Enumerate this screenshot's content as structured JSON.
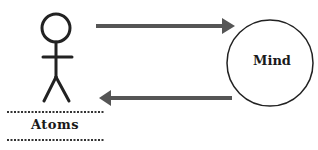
{
  "diagram": {
    "nodes": [
      {
        "id": "atoms",
        "label": "Atoms",
        "icon": "stick-figure-icon"
      },
      {
        "id": "mind",
        "label": "Mind",
        "shape": "circle"
      }
    ],
    "edges": [
      {
        "from": "atoms",
        "to": "mind",
        "direction": "right"
      },
      {
        "from": "mind",
        "to": "atoms",
        "direction": "left"
      }
    ],
    "colors": {
      "arrow": "#555555",
      "stroke": "#222222",
      "background": "#ffffff"
    }
  }
}
